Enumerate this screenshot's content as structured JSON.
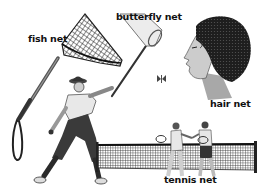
{
  "illustration": {
    "background": "#ffffff",
    "ink": "#1a1a1a",
    "labels": {
      "fish_net": "fish net",
      "butterfly_net": "butterfly net",
      "hair_net": "hair net",
      "tennis_net": "tennis net"
    },
    "figures": [
      {
        "name": "fish-net",
        "description": "long-handled mesh fishing net with loop grip"
      },
      {
        "name": "butterfly-net",
        "description": "light gauze net on a pole held by walking man"
      },
      {
        "name": "hair-net",
        "description": "profile of a woman with hair covered by a net"
      },
      {
        "name": "tennis-net",
        "description": "tennis net with two players shaking hands"
      },
      {
        "name": "butterfly",
        "description": "small butterfly near the butterfly net"
      }
    ]
  }
}
